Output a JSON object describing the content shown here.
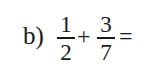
{
  "problem": {
    "label": "b)",
    "fraction1": {
      "numerator": "1",
      "denominator": "2"
    },
    "operator": "+",
    "fraction2": {
      "numerator": "3",
      "denominator": "7"
    },
    "equals": "="
  }
}
